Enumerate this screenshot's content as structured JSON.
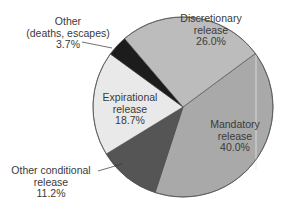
{
  "chart_data": {
    "type": "pie",
    "title": "",
    "center": [
      183,
      107
    ],
    "radius": 90,
    "start_angle_deg": 53.5,
    "direction": "clockwise",
    "slices": [
      {
        "key": "mandatory",
        "label": "Mandatory release",
        "value": 40.0,
        "color": "#a9a9a9"
      },
      {
        "key": "other_conditional",
        "label": "Other conditional release",
        "value": 11.2,
        "color": "#555555"
      },
      {
        "key": "expirational",
        "label": "Expirational release",
        "value": 18.7,
        "color": "#e9e9e9"
      },
      {
        "key": "other",
        "label": "Other (deaths, escapes)",
        "value": 3.7,
        "color": "#1c1c1c"
      },
      {
        "key": "discretionary",
        "label": "Discretionary release",
        "value": 26.0,
        "color": "#bcbcbc"
      }
    ]
  },
  "labels": {
    "discretionary": {
      "line1": "Discretionary",
      "line2": "release",
      "pct": "26.0%"
    },
    "mandatory": {
      "line1": "Mandatory",
      "line2": "release",
      "pct": "40.0%"
    },
    "expirational": {
      "line1": "Expirational",
      "line2": "release",
      "pct": "18.7%"
    },
    "other_conditional": {
      "line1": "Other conditional",
      "line2": "release",
      "pct": "11.2%"
    },
    "other": {
      "line1": "Other",
      "line2": "(deaths, escapes)",
      "pct": "3.7%"
    }
  }
}
